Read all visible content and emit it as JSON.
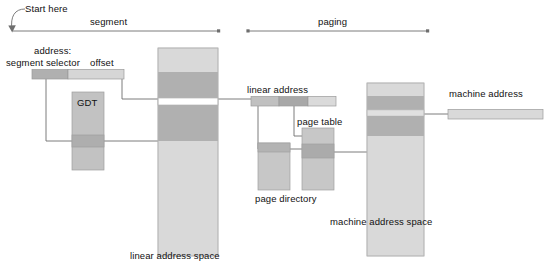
{
  "diagram": {
    "annotations": {
      "start_here": "Start here",
      "phase_segment": "segment",
      "phase_paging": "paging"
    },
    "labels": {
      "address": "address:",
      "segment_selector": "segment selector",
      "offset": "offset",
      "gdt": "GDT",
      "linear_address_space": "linear address space",
      "linear_address": "linear address",
      "page_directory": "page directory",
      "page_table": "page table",
      "machine_address": "machine address",
      "machine_address_space": "machine address space"
    },
    "colors": {
      "light_gray": "#d4d4d4",
      "mid_gray": "#bdbdbd",
      "dark_gray": "#a3a3a3",
      "line": "#6e6e6e",
      "text": "#111111",
      "white": "#ffffff"
    }
  }
}
